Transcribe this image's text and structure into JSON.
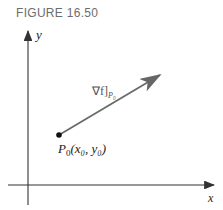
{
  "figure": {
    "caption": "FIGURE 16.50",
    "axes": {
      "x_label": "x",
      "y_label": "y"
    },
    "point": {
      "name": "P",
      "sub": "0",
      "coords_text": "(x₀, y₀)"
    },
    "vector": {
      "label_main": "∇f]",
      "label_sub": "P₀"
    },
    "colors": {
      "axis": "#333333",
      "vector": "#6a6a6a",
      "caption": "#6d6d6d"
    }
  }
}
